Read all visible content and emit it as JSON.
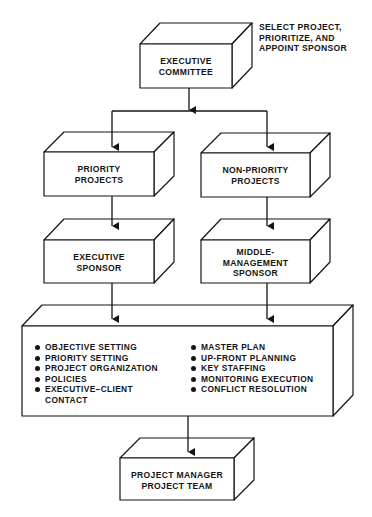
{
  "diagram": {
    "annotation": [
      "SELECT PROJECT,",
      "PRIORITIZE, AND",
      "APPOINT SPONSOR"
    ],
    "boxes": {
      "executive_committee": [
        "EXECUTIVE",
        "COMMITTEE"
      ],
      "priority_projects": [
        "PRIORITY",
        "PROJECTS"
      ],
      "non_priority_projects": [
        "NON-PRIORITY",
        "PROJECTS"
      ],
      "executive_sponsor": [
        "EXECUTIVE",
        "SPONSOR"
      ],
      "middle_management_sponsor": [
        "MIDDLE-",
        "MANAGEMENT",
        "SPONSOR"
      ],
      "project_manager": [
        "PROJECT MANAGER",
        "PROJECT TEAM"
      ]
    },
    "responsibilities": {
      "left": [
        "OBJECTIVE SETTING",
        "PRIORITY SETTING",
        "PROJECT ORGANIZATION",
        "POLICIES",
        "EXECUTIVE–CLIENT CONTACT"
      ],
      "right": [
        "MASTER PLAN",
        "UP-FRONT PLANNING",
        "KEY STAFFING",
        "MONITORING EXECUTION",
        "CONFLICT RESOLUTION"
      ]
    },
    "colors": {
      "line": "#141414",
      "background": "#ffffff"
    }
  }
}
